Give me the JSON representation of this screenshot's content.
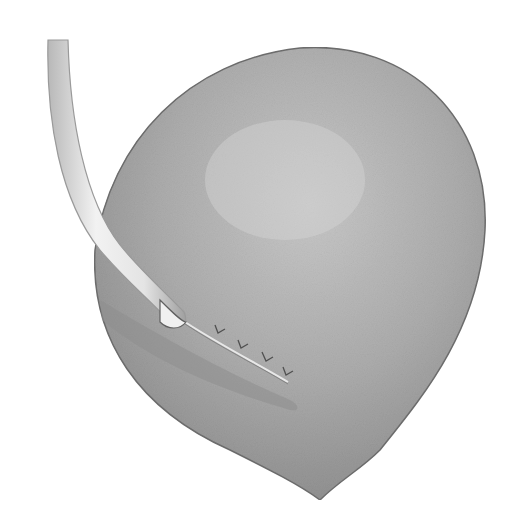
{
  "illustration": {
    "subject": "organ with catheter tube and sutured incision",
    "style": "grayscale pencil medical illustration",
    "colors": {
      "background": "#ffffff",
      "organ_light": "#c4c4c4",
      "organ_mid": "#a8a8a8",
      "organ_dark": "#8a8a8a",
      "outline": "#6e6e6e",
      "tube_fill": "#e6e6e6",
      "tube_edge": "#9a9a9a",
      "suture": "#505050"
    },
    "suture_count": 4
  }
}
